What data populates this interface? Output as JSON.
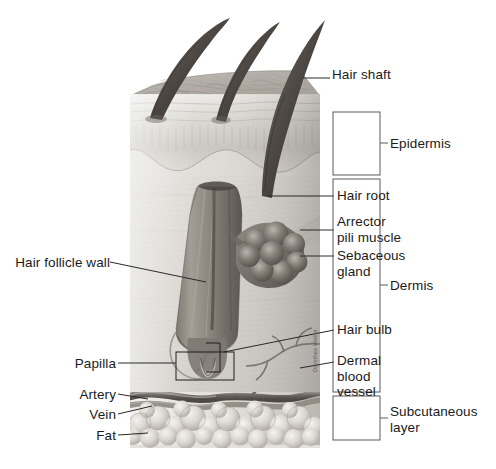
{
  "figure": {
    "artist_signature": "Dorothea Weber"
  },
  "colors": {
    "ink": "#1b1b1b",
    "leader": "#2a2a2a",
    "box_stroke": "#5a5a5a",
    "skin_light": "#e8e6e2",
    "skin_mid": "#cfcbc5",
    "skin_dark": "#9b968f",
    "follicle": "#8d8782",
    "background": "#ffffff"
  },
  "labels": {
    "right": [
      {
        "id": "hair-shaft",
        "text": "Hair shaft",
        "x": 332,
        "y": 74,
        "lines": [
          "Hair shaft"
        ]
      },
      {
        "id": "hair-root",
        "text": "Hair root",
        "x": 337,
        "y": 191,
        "lines": [
          "Hair root"
        ]
      },
      {
        "id": "arrector-pili",
        "text": "Arrector pili muscle",
        "x": 337,
        "y": 218,
        "lines": [
          "Arrector",
          "pili muscle"
        ]
      },
      {
        "id": "sebaceous-gland",
        "text": "Sebaceous gland",
        "x": 337,
        "y": 252,
        "lines": [
          "Sebaceous",
          "gland"
        ]
      },
      {
        "id": "hair-bulb",
        "text": "Hair bulb",
        "x": 337,
        "y": 325,
        "lines": [
          "Hair bulb"
        ]
      },
      {
        "id": "dermal-blood-vessel",
        "text": "Dermal blood vessel",
        "x": 337,
        "y": 356,
        "lines": [
          "Dermal",
          "blood",
          "vessel"
        ]
      }
    ],
    "left": [
      {
        "id": "hair-follicle-wall",
        "text": "Hair follicle wall",
        "x": 22,
        "y": 257,
        "lines": [
          "Hair follicle wall"
        ]
      },
      {
        "id": "papilla",
        "text": "Papilla",
        "x": 74,
        "y": 358,
        "lines": [
          "Papilla"
        ]
      },
      {
        "id": "artery",
        "text": "Artery",
        "x": 79,
        "y": 390,
        "lines": [
          "Artery"
        ]
      },
      {
        "id": "vein",
        "text": "Vein",
        "x": 87,
        "y": 410,
        "lines": [
          "Vein"
        ]
      },
      {
        "id": "fat",
        "text": "Fat",
        "x": 92,
        "y": 431,
        "lines": [
          "Fat"
        ]
      }
    ]
  },
  "layers": [
    {
      "id": "epidermis",
      "text": "Epidermis",
      "lines": [
        "Epidermis"
      ],
      "box": {
        "x": 333,
        "y": 112,
        "w": 47,
        "h": 63
      },
      "label_x": 390,
      "label_y": 136
    },
    {
      "id": "dermis",
      "text": "Dermis",
      "lines": [
        "Dermis"
      ],
      "box": {
        "x": 333,
        "y": 179,
        "w": 47,
        "h": 213
      },
      "label_x": 390,
      "label_y": 278
    },
    {
      "id": "subcutaneous",
      "text": "Subcutaneous layer",
      "lines": [
        "Subcutaneous",
        "layer"
      ],
      "box": {
        "x": 333,
        "y": 396,
        "w": 47,
        "h": 44
      },
      "label_x": 390,
      "label_y": 405
    }
  ],
  "skin_block": {
    "left": 130,
    "right": 320,
    "top": 95,
    "bottom": 445,
    "surface_top": 88
  }
}
